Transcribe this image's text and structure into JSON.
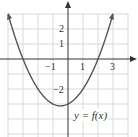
{
  "chart_data": {
    "type": "line",
    "title": "",
    "function_label": "y = f(x)",
    "equation_estimate": "f(x) = 0.5x^2 + 0.5x - 3",
    "xlabel": "",
    "ylabel": "",
    "xlim": [
      -4,
      4
    ],
    "ylim": [
      -5,
      3
    ],
    "grid": true,
    "x_tick_labels": [
      "-1",
      "1",
      "3"
    ],
    "y_tick_labels": [
      "2",
      "1",
      "-2"
    ],
    "series": [
      {
        "name": "y = f(x)",
        "x": [
          -4,
          -3.5,
          -3,
          -2.5,
          -2,
          -1.5,
          -1,
          -0.5,
          0,
          0.5,
          1,
          1.5,
          2,
          2.5,
          3
        ],
        "y": [
          3,
          1.375,
          0,
          -1.125,
          -2,
          -2.625,
          -3,
          -3.125,
          -3,
          -2.625,
          -2,
          -1.125,
          0,
          1.375,
          3
        ]
      }
    ],
    "key_points": {
      "x_intercepts": [
        -3,
        2
      ],
      "y_intercept": -3,
      "vertex": [
        -0.5,
        -3.125
      ]
    },
    "colors": {
      "curve": "#555555",
      "grid": "#d8d8d8",
      "axis": "#333333"
    }
  },
  "labels": {
    "x_neg1": "−1",
    "x_1": "1",
    "x_3": "3",
    "y_2": "2",
    "y_1": "1",
    "y_neg2": "−2",
    "function": "y = f(x)"
  }
}
